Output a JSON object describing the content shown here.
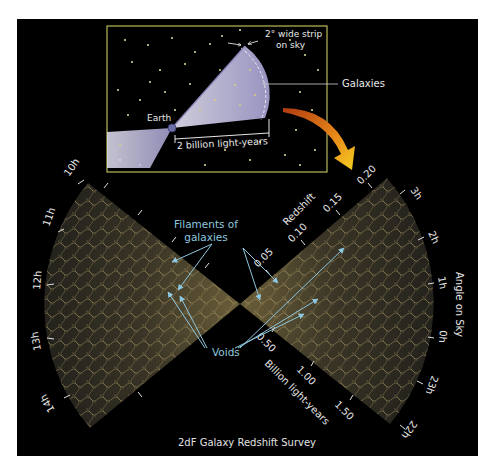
{
  "figure": {
    "caption": "2dF Galaxy Redshift Survey",
    "colors": {
      "panel_background": "#000000",
      "inset_border": "#b8b85a",
      "wedge_fill": "#2a271d",
      "filament": "#c9b57a",
      "annotation_blue": "#8ec7df",
      "beam_fill": "#c7c3e6",
      "arrow_orange": "#e8a020"
    },
    "inset": {
      "strip_label_line1": "2° wide strip",
      "strip_label_line2": "on sky",
      "galaxies_label": "Galaxies",
      "earth_label": "Earth",
      "distance_label": "2 billion light-years"
    },
    "annotations": {
      "filaments_line1": "Filaments of",
      "filaments_line2": "galaxies",
      "voids": "Voids"
    },
    "redshift_axis": {
      "title": "Redshift",
      "ticks": [
        "0.05",
        "0.10",
        "0.15",
        "0.20"
      ]
    },
    "distance_axis": {
      "title": "Billion light-years",
      "ticks": [
        "0.50",
        "1.00",
        "1.50"
      ]
    },
    "angle_axis": {
      "title": "Angle on Sky",
      "left_wedge_hours": [
        "10h",
        "11h",
        "12h",
        "13h",
        "14h"
      ],
      "right_wedge_hours": [
        "3h",
        "2h",
        "1h",
        "0h",
        "23h",
        "22h"
      ]
    }
  }
}
